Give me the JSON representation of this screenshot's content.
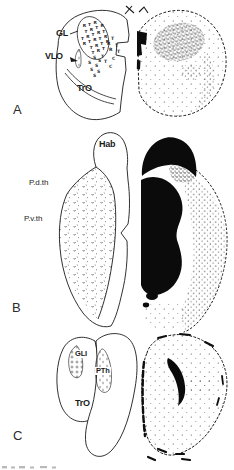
{
  "figure_meta": {
    "kind": "brain-section-autoradiography-figure",
    "ink_color": "#1a1a1a",
    "paper_color": "#ffffff"
  },
  "panel_a": {
    "letter": "A",
    "labels": {
      "gl": "GL",
      "vlo": "VLO",
      "tro": "TrO"
    },
    "symbols": {
      "oval_grid": {
        "chars": [
          "R",
          "T"
        ],
        "cx": 93,
        "cy": 38,
        "rx": 14,
        "ry": 21,
        "rot_deg": -18,
        "step": 5.6,
        "font_size": 4.3
      },
      "scatter": [
        {
          "c": "T",
          "x": 111,
          "y": 40
        },
        {
          "c": "R",
          "x": 107,
          "y": 45
        },
        {
          "c": "T",
          "x": 115,
          "y": 47
        },
        {
          "c": "R",
          "x": 109,
          "y": 51
        },
        {
          "c": "T",
          "x": 117,
          "y": 53
        },
        {
          "c": "S",
          "x": 93,
          "y": 59
        },
        {
          "c": "T",
          "x": 101,
          "y": 58
        },
        {
          "c": "S",
          "x": 98,
          "y": 62
        },
        {
          "c": "S",
          "x": 88,
          "y": 64
        },
        {
          "c": "T",
          "x": 104,
          "y": 63
        },
        {
          "c": "C",
          "x": 112,
          "y": 60
        },
        {
          "c": "S",
          "x": 95,
          "y": 67
        },
        {
          "c": "S",
          "x": 90,
          "y": 71
        },
        {
          "c": "S",
          "x": 97,
          "y": 73
        },
        {
          "c": "C",
          "x": 109,
          "y": 68
        },
        {
          "c": "S",
          "x": 93,
          "y": 77
        }
      ]
    }
  },
  "panel_b": {
    "letter": "B",
    "labels": {
      "hab": "Hab",
      "pdth": "P.d.th",
      "pvth": "P.v.th"
    }
  },
  "panel_c": {
    "letter": "C",
    "labels": {
      "gli": "GLI",
      "pth": "PTh",
      "tro": "TrO"
    }
  }
}
